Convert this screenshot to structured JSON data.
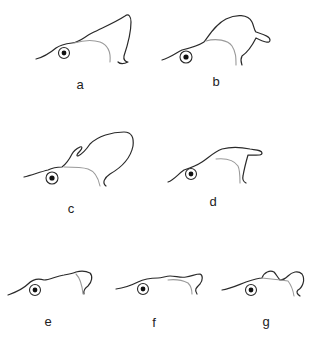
{
  "figure": {
    "panels": [
      {
        "id": "a",
        "label": "a",
        "crest": "tall backward-sloping crest ending in downward hook"
      },
      {
        "id": "b",
        "label": "b",
        "crest": "rounded crest with backward-pointing lobe"
      },
      {
        "id": "c",
        "label": "c",
        "crest": "large rounded crest with small forward finger"
      },
      {
        "id": "d",
        "label": "d",
        "crest": "flat crest with backward-pointing flap"
      },
      {
        "id": "e",
        "label": "e",
        "crest": "low crest with small rear lobe"
      },
      {
        "id": "f",
        "label": "f",
        "crest": "low wavy crest with small rear lobe"
      },
      {
        "id": "g",
        "label": "g",
        "crest": "low crest with small bump and rear lobe"
      }
    ],
    "colors": {
      "outline": "#2a2a2a",
      "inner_contour": "#9a9a9a",
      "pupil": "#111111",
      "background": "#ffffff"
    }
  }
}
